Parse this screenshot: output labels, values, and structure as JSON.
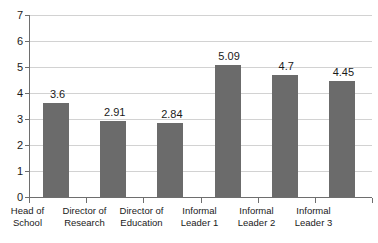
{
  "chart_data": {
    "type": "bar",
    "title": "",
    "subtitle": "",
    "xlabel": "",
    "ylabel": "",
    "categories": [
      "Head of School",
      "Director of Research",
      "Director of Education",
      "Informal Leader 1",
      "Informal Leader 2",
      "Informal Leader 3"
    ],
    "category_lines": [
      [
        "Head of",
        "School"
      ],
      [
        "Director of",
        "Research"
      ],
      [
        "Director of",
        "Education"
      ],
      [
        "Informal",
        "Leader 1"
      ],
      [
        "Informal",
        "Leader 2"
      ],
      [
        "Informal",
        "Leader 3"
      ]
    ],
    "values": [
      3.6,
      2.91,
      2.84,
      5.09,
      4.7,
      4.45
    ],
    "value_labels": [
      "3.6",
      "2.91",
      "2.84",
      "5.09",
      "4.7",
      "4.45"
    ],
    "ylim": [
      0,
      7
    ],
    "ytick_values": [
      0,
      1,
      2,
      3,
      4,
      5,
      6,
      7
    ],
    "ytick_labels": [
      "0",
      "1",
      "2",
      "3",
      "4",
      "5",
      "6",
      "7"
    ],
    "grid": true,
    "legend": "none",
    "bar_color": "#6b6b6b",
    "gridline_color": "#d2d2d2",
    "axis_color": "#6e6e6e",
    "background_color": "#ffffff",
    "text_color": "#1a1a1a"
  }
}
